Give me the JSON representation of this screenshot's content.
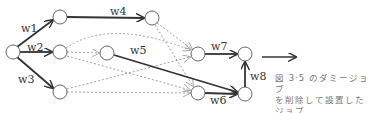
{
  "diagram": {
    "nodes": [
      {
        "id": "n0",
        "x": 13,
        "y": 52
      },
      {
        "id": "n1",
        "x": 60,
        "y": 17
      },
      {
        "id": "n2",
        "x": 60,
        "y": 52
      },
      {
        "id": "n3",
        "x": 60,
        "y": 92
      },
      {
        "id": "n4",
        "x": 152,
        "y": 18
      },
      {
        "id": "n5",
        "x": 107,
        "y": 53
      },
      {
        "id": "n6",
        "x": 198,
        "y": 54
      },
      {
        "id": "n7",
        "x": 198,
        "y": 93
      },
      {
        "id": "n8",
        "x": 245,
        "y": 54
      },
      {
        "id": "n9",
        "x": 245,
        "y": 94
      }
    ],
    "edge_labels": {
      "w1": "w1",
      "w2": "w2",
      "w3": "w3",
      "w4": "w4",
      "w5": "w5",
      "w6": "w6",
      "w7": "w7",
      "w8": "w8"
    },
    "colors": {
      "solid_edge": "#333333",
      "dashed_edge": "#999999",
      "node_stroke": "#555555"
    }
  },
  "caption": {
    "line1": "図 3·5 のダミージョブ",
    "line2": "を削除して設置した",
    "line3": "ジョブ"
  }
}
